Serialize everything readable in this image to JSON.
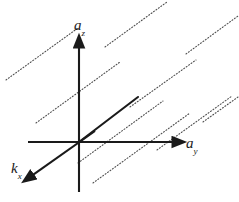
{
  "figure": {
    "kind": "vector-axes-diagram",
    "width": 239,
    "height": 202,
    "background_color": "#ffffff",
    "line_color": "#1a1a1a",
    "dotted_line_color": "#4d4d4d",
    "labels": {
      "z_axis": {
        "base": "a",
        "sub": "z",
        "text": "az"
      },
      "y_axis": {
        "base": "a",
        "sub": "y",
        "text": "ay"
      },
      "x_axis": {
        "base": "k",
        "sub": "x",
        "text": "kx"
      }
    },
    "chart_data": {
      "type": "scatter",
      "title": "",
      "xlabel": "ay",
      "ylabel": "az",
      "grid": false,
      "legend": null,
      "origin": {
        "x": 79,
        "y": 142
      },
      "axes": [
        {
          "name": "a_z",
          "label": "az",
          "direction": "up",
          "arrow": true,
          "from": {
            "x": 79,
            "y": 192
          },
          "to": {
            "x": 79,
            "y": 40
          },
          "label_pos": {
            "x": 74,
            "y": 18
          }
        },
        {
          "name": "a_y",
          "label": "ay",
          "direction": "right",
          "arrow": true,
          "from": {
            "x": 28,
            "y": 142
          },
          "to": {
            "x": 180,
            "y": 142
          },
          "label_pos": {
            "x": 186,
            "y": 136
          }
        },
        {
          "name": "k_x",
          "label": "kx",
          "direction": "down-left",
          "arrow": true,
          "from": {
            "x": 95,
            "y": 131
          },
          "to": {
            "x": 27,
            "y": 179
          },
          "label_pos": {
            "x": 11,
            "y": 161
          }
        }
      ],
      "solid_ray": {
        "name": "lattice-vector-ray",
        "from": {
          "x": 79,
          "y": 142
        },
        "to": {
          "x": 138,
          "y": 97
        },
        "arrow": false
      },
      "dotted_lines": {
        "count": 9,
        "slope_deg": -36,
        "dash_pattern": "1,2",
        "segments": [
          {
            "x1": 6,
            "y1": 80,
            "x2": 78,
            "y2": 28
          },
          {
            "x1": 36,
            "y1": 123,
            "x2": 120,
            "y2": 62
          },
          {
            "x1": 78,
            "y1": 163,
            "x2": 163,
            "y2": 101
          },
          {
            "x1": 93,
            "y1": 183,
            "x2": 190,
            "y2": 113
          },
          {
            "x1": 105,
            "y1": 47,
            "x2": 167,
            "y2": 2
          },
          {
            "x1": 130,
            "y1": 107,
            "x2": 196,
            "y2": 60
          },
          {
            "x1": 157,
            "y1": 150,
            "x2": 232,
            "y2": 96
          },
          {
            "x1": 186,
            "y1": 54,
            "x2": 238,
            "y2": 16
          },
          {
            "x1": 203,
            "y1": 122,
            "x2": 238,
            "y2": 97
          }
        ]
      }
    }
  }
}
